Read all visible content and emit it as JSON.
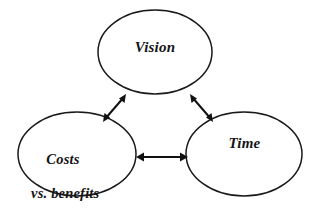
{
  "diagram": {
    "type": "relationship-triangle",
    "background_color": "#ffffff",
    "stroke_color": "#1a1a1a",
    "text_color": "#141414",
    "nodes": [
      {
        "id": "vision",
        "label": "Vision",
        "shape": "ellipse",
        "center": [
          155,
          52
        ],
        "radius_x": 57,
        "radius_y": 42
      },
      {
        "id": "costs",
        "label_line_1": "Costs",
        "label_line_2": "vs. benefits",
        "label": "Costs vs. benefits",
        "shape": "ellipse",
        "center": [
          77,
          154
        ],
        "radius_x": 59,
        "radius_y": 42
      },
      {
        "id": "time",
        "label": "Time",
        "shape": "ellipse",
        "center": [
          244,
          154
        ],
        "radius_x": 58,
        "radius_y": 42
      }
    ],
    "connectors": [
      {
        "id": "costs-vision",
        "from": "costs",
        "to": "vision",
        "style": "double-headed-arrow",
        "orientation": "diagonal-up-right"
      },
      {
        "id": "vision-time",
        "from": "vision",
        "to": "time",
        "style": "double-headed-arrow",
        "orientation": "diagonal-down-right"
      },
      {
        "id": "costs-time",
        "from": "costs",
        "to": "time",
        "style": "double-headed-arrow",
        "orientation": "horizontal"
      }
    ]
  }
}
